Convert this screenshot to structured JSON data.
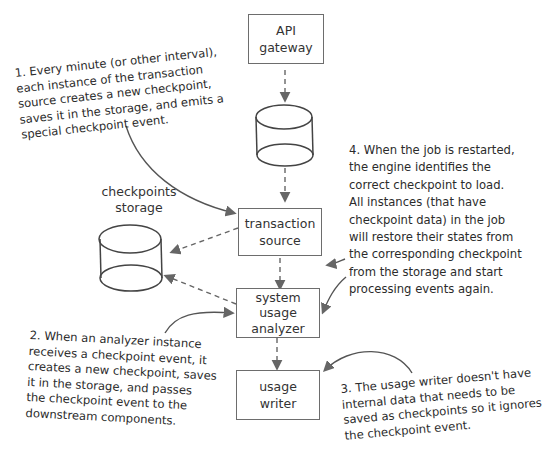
{
  "diagram": {
    "nodes": {
      "api_gateway": {
        "line1": "API",
        "line2": "gateway"
      },
      "transaction_source": {
        "line1": "transaction",
        "line2": "source"
      },
      "system_usage_analyzer": {
        "line1": "system",
        "line2": "usage",
        "line3": "analyzer"
      },
      "usage_writer": {
        "line1": "usage",
        "line2": "writer"
      },
      "checkpoints_storage": {
        "line1": "checkpoints",
        "line2": "storage"
      }
    },
    "notes": {
      "note1": "1. Every minute (or other interval),\neach instance of the transaction\nsource creates a new checkpoint,\nsaves it in the storage, and emits a\nspecial checkpoint event.",
      "note2": "2. When an analyzer instance\nreceives a checkpoint event, it\ncreates a new checkpoint, saves\nit in the storage, and passes\nthe checkpoint event to the\ndownstream components.",
      "note3": "3. The usage writer doesn't have\ninternal data that needs to be\nsaved as checkpoints so it ignores\nthe checkpoint event.",
      "note4": "4. When the job is restarted,\nthe engine identifies the\ncorrect checkpoint to load.\nAll instances (that have\ncheckpoint data) in the job\nwill restore their states from\nthe corresponding checkpoint\nfrom the storage and start\nprocessing events again."
    },
    "colors": {
      "stroke": "#555555",
      "arrow": "#666666",
      "text": "#2b2b2b"
    }
  }
}
